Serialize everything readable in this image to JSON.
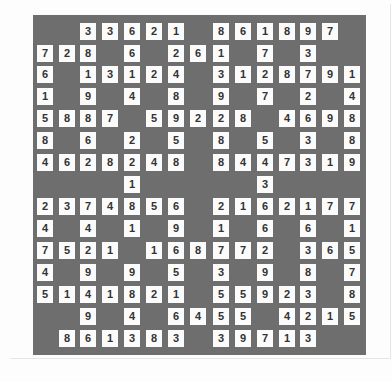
{
  "puzzle": {
    "colors": {
      "board": "#6e6e6e",
      "cell": "#fbfbfb",
      "digit": "#333333"
    },
    "rows": [
      "  33621 861897 ",
      "728 6 261 7 3  ",
      "6 13124 3128791",
      "1 9 4 8 9 7 2 4",
      "5887 59228 4698",
      "8 6 2 5 8 5 3 8",
      "4628248 8447319",
      "    1     3    ",
      "2374856 2162177",
      "4 4 1 9 1 6 6 1",
      "7521 168772 365",
      "4 9 9 5 3 9 8 7",
      "5141821 55923 8",
      "  9 4 6455 4215",
      " 861383 39713  "
    ]
  }
}
